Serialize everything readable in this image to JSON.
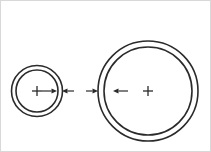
{
  "drawing": {
    "title": "Concentric ring pair with radial dimension arrows",
    "background_color": "#ffffff",
    "line_color": "#2b2b2b",
    "frame_color": "#d8d8d8",
    "canvas": {
      "width": 211,
      "height": 152
    },
    "assemblies": [
      {
        "id": "left-ring-assembly",
        "name": "Small concentric ring assembly",
        "center": {
          "x": 37,
          "y": 91
        },
        "center_mark": {
          "type": "cross",
          "arm_length": 5
        },
        "rings": [
          {
            "name": "outer-ring",
            "radius": 25.5,
            "stroke_width": 1.6
          },
          {
            "name": "inner-ring",
            "radius": 21.0,
            "stroke_width": 1.6
          }
        ],
        "dimension_arrows": [
          {
            "name": "inner-radius-arrow",
            "direction": "right",
            "from_x": 42,
            "to_x": 57,
            "y": 91
          },
          {
            "name": "outer-edge-arrow",
            "direction": "left",
            "from_x": 74,
            "to_x": 62,
            "y": 91
          }
        ]
      },
      {
        "id": "right-ring-assembly",
        "name": "Large concentric ring assembly",
        "center": {
          "x": 148,
          "y": 91
        },
        "center_mark": {
          "type": "cross",
          "arm_length": 5
        },
        "rings": [
          {
            "name": "outer-ring",
            "radius": 50.0,
            "stroke_width": 1.6
          },
          {
            "name": "inner-ring",
            "radius": 44.0,
            "stroke_width": 1.6
          }
        ],
        "dimension_arrows": [
          {
            "name": "outer-edge-arrow",
            "direction": "right",
            "from_x": 86,
            "to_x": 98,
            "y": 91
          },
          {
            "name": "inner-radius-arrow",
            "direction": "left",
            "from_x": 128,
            "to_x": 113,
            "y": 91
          }
        ]
      }
    ],
    "labels": {
      "left_assembly_label": "",
      "right_assembly_label": "",
      "caption": ""
    }
  }
}
